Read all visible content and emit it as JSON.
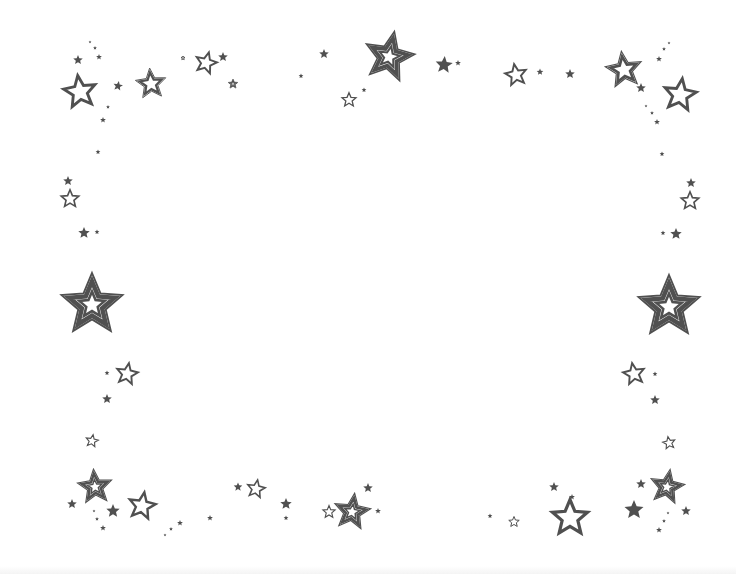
{
  "image": {
    "description": "Decorative star border frame with empty white center",
    "background_color": "#ffffff",
    "star_color": "#505050",
    "star_styles": [
      "solid",
      "outline",
      "double-outline",
      "triple-outline"
    ]
  },
  "stars": [
    {
      "x": 80,
      "y": 92,
      "r": 18,
      "style": "outline",
      "rot": -8
    },
    {
      "x": 78,
      "y": 60,
      "r": 5,
      "style": "solid",
      "rot": 0
    },
    {
      "x": 99,
      "y": 57,
      "r": 3,
      "style": "solid",
      "rot": 0
    },
    {
      "x": 90,
      "y": 42,
      "r": 1.5,
      "style": "solid",
      "rot": 0
    },
    {
      "x": 95,
      "y": 48,
      "r": 2,
      "style": "solid",
      "rot": 0
    },
    {
      "x": 118,
      "y": 86,
      "r": 5,
      "style": "solid",
      "rot": 10
    },
    {
      "x": 108,
      "y": 107,
      "r": 2,
      "style": "solid",
      "rot": 0
    },
    {
      "x": 103,
      "y": 120,
      "r": 3,
      "style": "solid",
      "rot": 0
    },
    {
      "x": 98,
      "y": 152,
      "r": 2.5,
      "style": "solid",
      "rot": 0
    },
    {
      "x": 151,
      "y": 84,
      "r": 16,
      "style": "double-outline",
      "rot": -5
    },
    {
      "x": 183,
      "y": 58,
      "r": 2.5,
      "style": "outline",
      "rot": 0
    },
    {
      "x": 206,
      "y": 63,
      "r": 12,
      "style": "outline",
      "rot": 15
    },
    {
      "x": 223,
      "y": 57,
      "r": 5,
      "style": "solid",
      "rot": 0
    },
    {
      "x": 233,
      "y": 84,
      "r": 5,
      "style": "triple-outline",
      "rot": 0
    },
    {
      "x": 301,
      "y": 76,
      "r": 2.5,
      "style": "solid",
      "rot": 0
    },
    {
      "x": 324,
      "y": 54,
      "r": 5,
      "style": "solid",
      "rot": 0
    },
    {
      "x": 389,
      "y": 57,
      "r": 26,
      "style": "triple-outline",
      "rot": 12
    },
    {
      "x": 349,
      "y": 100,
      "r": 8,
      "style": "outline",
      "rot": 0
    },
    {
      "x": 364,
      "y": 90,
      "r": 2.5,
      "style": "solid",
      "rot": 0
    },
    {
      "x": 444,
      "y": 65,
      "r": 9,
      "style": "solid",
      "rot": 5
    },
    {
      "x": 458,
      "y": 63,
      "r": 3,
      "style": "solid",
      "rot": 0
    },
    {
      "x": 516,
      "y": 75,
      "r": 12,
      "style": "outline",
      "rot": -10
    },
    {
      "x": 540,
      "y": 72,
      "r": 3.5,
      "style": "solid",
      "rot": 0
    },
    {
      "x": 570,
      "y": 74,
      "r": 5,
      "style": "solid",
      "rot": 0
    },
    {
      "x": 624,
      "y": 70,
      "r": 19,
      "style": "double-outline",
      "rot": -8
    },
    {
      "x": 641,
      "y": 88,
      "r": 5,
      "style": "solid",
      "rot": 0
    },
    {
      "x": 680,
      "y": 95,
      "r": 18,
      "style": "outline",
      "rot": 8
    },
    {
      "x": 659,
      "y": 59,
      "r": 3,
      "style": "solid",
      "rot": 0
    },
    {
      "x": 664,
      "y": 49,
      "r": 2,
      "style": "solid",
      "rot": 0
    },
    {
      "x": 669,
      "y": 43,
      "r": 1.5,
      "style": "solid",
      "rot": 0
    },
    {
      "x": 646,
      "y": 106,
      "r": 1.5,
      "style": "solid",
      "rot": 0
    },
    {
      "x": 652,
      "y": 113,
      "r": 2,
      "style": "solid",
      "rot": 0
    },
    {
      "x": 657,
      "y": 122,
      "r": 3,
      "style": "solid",
      "rot": 0
    },
    {
      "x": 662,
      "y": 154,
      "r": 2.5,
      "style": "solid",
      "rot": 0
    },
    {
      "x": 68,
      "y": 181,
      "r": 5,
      "style": "solid",
      "rot": 0
    },
    {
      "x": 70,
      "y": 199,
      "r": 10,
      "style": "outline",
      "rot": 0
    },
    {
      "x": 84,
      "y": 233,
      "r": 6,
      "style": "solid",
      "rot": 0
    },
    {
      "x": 97,
      "y": 232,
      "r": 2.5,
      "style": "solid",
      "rot": 0
    },
    {
      "x": 92,
      "y": 305,
      "r": 32,
      "style": "triple-outline",
      "rot": 0
    },
    {
      "x": 691,
      "y": 183,
      "r": 5,
      "style": "solid",
      "rot": 0
    },
    {
      "x": 690,
      "y": 201,
      "r": 10,
      "style": "outline",
      "rot": 0
    },
    {
      "x": 676,
      "y": 234,
      "r": 6,
      "style": "solid",
      "rot": 0
    },
    {
      "x": 663,
      "y": 233,
      "r": 2.5,
      "style": "solid",
      "rot": 0
    },
    {
      "x": 669,
      "y": 307,
      "r": 32,
      "style": "triple-outline",
      "rot": 0
    },
    {
      "x": 127,
      "y": 374,
      "r": 12,
      "style": "outline",
      "rot": 10
    },
    {
      "x": 107,
      "y": 373,
      "r": 2.5,
      "style": "solid",
      "rot": 0
    },
    {
      "x": 107,
      "y": 399,
      "r": 5,
      "style": "solid",
      "rot": 0
    },
    {
      "x": 92,
      "y": 441,
      "r": 7,
      "style": "outline",
      "rot": 10
    },
    {
      "x": 634,
      "y": 374,
      "r": 12,
      "style": "outline",
      "rot": -10
    },
    {
      "x": 655,
      "y": 374,
      "r": 2.5,
      "style": "solid",
      "rot": 0
    },
    {
      "x": 655,
      "y": 400,
      "r": 5,
      "style": "solid",
      "rot": 0
    },
    {
      "x": 669,
      "y": 443,
      "r": 7,
      "style": "outline",
      "rot": -10
    },
    {
      "x": 95,
      "y": 487,
      "r": 18,
      "style": "triple-outline",
      "rot": -5
    },
    {
      "x": 72,
      "y": 504,
      "r": 5,
      "style": "solid",
      "rot": 0
    },
    {
      "x": 113,
      "y": 511,
      "r": 7,
      "style": "solid",
      "rot": 0
    },
    {
      "x": 142,
      "y": 506,
      "r": 15,
      "style": "outline",
      "rot": 10
    },
    {
      "x": 94,
      "y": 511,
      "r": 1.5,
      "style": "solid",
      "rot": 0
    },
    {
      "x": 97,
      "y": 519,
      "r": 2,
      "style": "solid",
      "rot": 0
    },
    {
      "x": 103,
      "y": 528,
      "r": 3,
      "style": "solid",
      "rot": 0
    },
    {
      "x": 165,
      "y": 535,
      "r": 1.5,
      "style": "solid",
      "rot": 0
    },
    {
      "x": 171,
      "y": 529,
      "r": 2,
      "style": "solid",
      "rot": 0
    },
    {
      "x": 180,
      "y": 523,
      "r": 3,
      "style": "solid",
      "rot": 0
    },
    {
      "x": 210,
      "y": 518,
      "r": 3,
      "style": "solid",
      "rot": 0
    },
    {
      "x": 238,
      "y": 487,
      "r": 4.5,
      "style": "solid",
      "rot": 0
    },
    {
      "x": 256,
      "y": 489,
      "r": 10,
      "style": "outline",
      "rot": 10
    },
    {
      "x": 286,
      "y": 504,
      "r": 6,
      "style": "solid",
      "rot": 0
    },
    {
      "x": 286,
      "y": 518,
      "r": 2.5,
      "style": "solid",
      "rot": 0
    },
    {
      "x": 329,
      "y": 512,
      "r": 7,
      "style": "outline",
      "rot": 0
    },
    {
      "x": 352,
      "y": 512,
      "r": 19,
      "style": "triple-outline",
      "rot": 8
    },
    {
      "x": 368,
      "y": 488,
      "r": 5,
      "style": "solid",
      "rot": 0
    },
    {
      "x": 378,
      "y": 511,
      "r": 3,
      "style": "solid",
      "rot": 0
    },
    {
      "x": 490,
      "y": 516,
      "r": 2.5,
      "style": "solid",
      "rot": 0
    },
    {
      "x": 514,
      "y": 522,
      "r": 6,
      "style": "outline",
      "rot": 0
    },
    {
      "x": 554,
      "y": 487,
      "r": 5,
      "style": "solid",
      "rot": 0
    },
    {
      "x": 572,
      "y": 497,
      "r": 3,
      "style": "solid",
      "rot": 0
    },
    {
      "x": 570,
      "y": 518,
      "r": 20,
      "style": "outline",
      "rot": 0
    },
    {
      "x": 634,
      "y": 510,
      "r": 10,
      "style": "solid",
      "rot": 0
    },
    {
      "x": 641,
      "y": 484,
      "r": 5,
      "style": "solid",
      "rot": 0
    },
    {
      "x": 667,
      "y": 487,
      "r": 18,
      "style": "triple-outline",
      "rot": 10
    },
    {
      "x": 686,
      "y": 511,
      "r": 5,
      "style": "solid",
      "rot": 0
    },
    {
      "x": 668,
      "y": 513,
      "r": 1.5,
      "style": "solid",
      "rot": 0
    },
    {
      "x": 664,
      "y": 521,
      "r": 2,
      "style": "solid",
      "rot": 0
    },
    {
      "x": 659,
      "y": 530,
      "r": 3,
      "style": "solid",
      "rot": 0
    }
  ]
}
